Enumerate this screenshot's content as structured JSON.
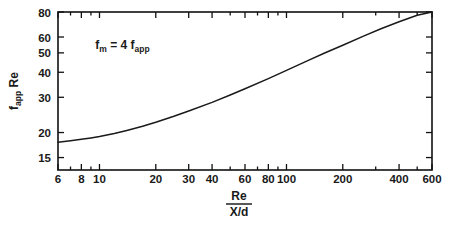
{
  "chart_data": {
    "type": "line",
    "title": "",
    "subtitle": "",
    "xlabel_numerator": "Re",
    "xlabel_denominator": "X/d",
    "ylabel_main": "f",
    "ylabel_sub": "app",
    "ylabel_tail": " Re",
    "xscale": "log",
    "yscale": "log",
    "xlim": [
      6,
      600
    ],
    "ylim": [
      13.0,
      80
    ],
    "grid": false,
    "legend": "none",
    "annotations": [
      {
        "text_parts": {
          "f": "f",
          "m": "m",
          "eq": " = 4 f",
          "app": "app"
        },
        "x": 9.5,
        "y": 52
      }
    ],
    "xticks": [
      6,
      8,
      10,
      20,
      30,
      40,
      60,
      80,
      100,
      200,
      400,
      600
    ],
    "xtick_labels": [
      "6",
      "8",
      "10",
      "20",
      "30",
      "40",
      "60",
      "80",
      "100",
      "200",
      "400",
      "600"
    ],
    "xticks_minor": [
      7,
      9,
      50,
      70,
      90,
      300,
      500
    ],
    "yticks": [
      15,
      20,
      30,
      40,
      50,
      60,
      80
    ],
    "ytick_labels": [
      "15",
      "20",
      "30",
      "40",
      "50",
      "60",
      "80"
    ],
    "series": [
      {
        "name": "f_app Re",
        "x": [
          6,
          7,
          8,
          9,
          10,
          12,
          14,
          17,
          20,
          25,
          30,
          40,
          50,
          60,
          80,
          100,
          130,
          160,
          200,
          260,
          320,
          400,
          500,
          600
        ],
        "values": [
          17.9,
          18.2,
          18.5,
          18.8,
          19.1,
          19.8,
          20.5,
          21.5,
          22.5,
          24.1,
          25.6,
          28.3,
          30.8,
          33.1,
          37.2,
          40.9,
          45.7,
          49.9,
          54.6,
          60.8,
          66.0,
          71.5,
          77.0,
          80.0
        ]
      }
    ]
  },
  "colors": {
    "background": "#ffffff",
    "ink": "#111111",
    "curve": "#1a1a1a"
  }
}
